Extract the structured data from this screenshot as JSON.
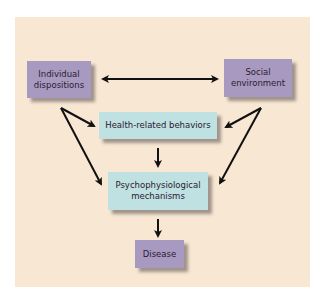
{
  "diagram": {
    "nodes": {
      "individual": {
        "label_line1": "Individual",
        "label_line2": "dispositions",
        "color": "#a899c0"
      },
      "social": {
        "label_line1": "Social",
        "label_line2": "environment",
        "color": "#a899c0"
      },
      "health": {
        "label": "Health-related behaviors",
        "color": "#bfe1e2"
      },
      "psycho": {
        "label_line1": "Psychophysiological",
        "label_line2": "mechanisms",
        "color": "#bfe1e2"
      },
      "disease": {
        "label": "Disease",
        "color": "#a899c0"
      }
    },
    "edges": [
      {
        "from": "Individual dispositions",
        "to": "Social environment",
        "type": "bidirectional"
      },
      {
        "from": "Individual dispositions",
        "to": "Health-related behaviors"
      },
      {
        "from": "Individual dispositions",
        "to": "Psychophysiological mechanisms"
      },
      {
        "from": "Social environment",
        "to": "Health-related behaviors"
      },
      {
        "from": "Social environment",
        "to": "Psychophysiological mechanisms"
      },
      {
        "from": "Health-related behaviors",
        "to": "Psychophysiological mechanisms"
      },
      {
        "from": "Psychophysiological mechanisms",
        "to": "Disease"
      }
    ],
    "background_color": "#f8e7d2"
  }
}
